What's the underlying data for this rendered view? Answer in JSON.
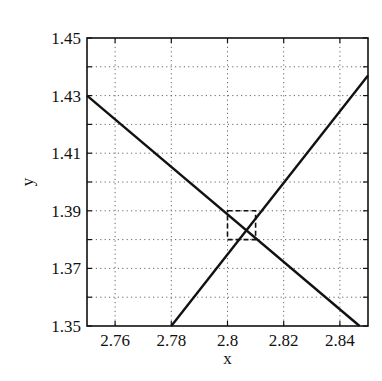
{
  "chart_data": {
    "type": "line",
    "title": "",
    "xlabel": "x",
    "ylabel": "y",
    "xlim": [
      2.75,
      2.85
    ],
    "ylim": [
      1.35,
      1.45
    ],
    "x_ticks": [
      2.76,
      2.78,
      2.8,
      2.82,
      2.84
    ],
    "x_tick_labels": [
      "2.76",
      "2.78",
      "2.8",
      "2.82",
      "2.84"
    ],
    "y_ticks": [
      1.35,
      1.37,
      1.39,
      1.41,
      1.43,
      1.45
    ],
    "y_tick_labels": [
      "1.35",
      "1.37",
      "1.39",
      "1.41",
      "1.43",
      "1.45"
    ],
    "y_minor_grid": [
      1.36,
      1.38,
      1.4,
      1.42,
      1.44
    ],
    "grid": true,
    "grid_style": "dotted",
    "legend": null,
    "series": [
      {
        "name": "line-descending",
        "x": [
          2.75,
          2.847
        ],
        "y": [
          1.43,
          1.35
        ],
        "color": "#111111"
      },
      {
        "name": "line-ascending",
        "x": [
          2.78,
          2.85
        ],
        "y": [
          1.35,
          1.437
        ],
        "color": "#111111"
      }
    ],
    "annotations": [
      {
        "type": "dashed-rectangle",
        "x": [
          2.8,
          2.81
        ],
        "y": [
          1.38,
          1.39
        ],
        "note": "zoom region around intersection"
      }
    ]
  }
}
